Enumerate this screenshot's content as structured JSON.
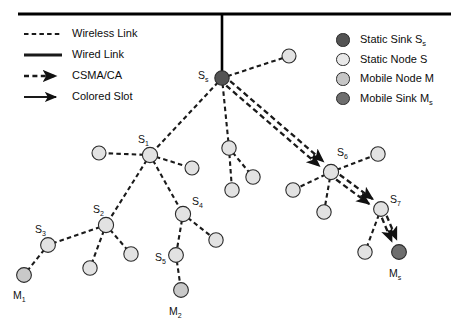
{
  "figure": {
    "width": 454,
    "height": 327,
    "background": "#ffffff"
  },
  "colors": {
    "static_sink": "#535353",
    "static_node": "#e2e2e2",
    "mobile_node": "#c9c9c9",
    "mobile_sink": "#6e6e6e",
    "node_stroke": "#2b2b2b",
    "link": "#1a1a1a",
    "backbone": "#000000",
    "text": "#111111"
  },
  "legend_left": {
    "items": [
      {
        "label": "Wireless Link",
        "style": "dashed-line",
        "name": "wireless-link"
      },
      {
        "label": "Wired Link",
        "style": "solid-line",
        "name": "wired-link"
      },
      {
        "label": "CSMA/CA",
        "style": "dashed-arrow",
        "name": "csma-ca"
      },
      {
        "label": "Colored Slot",
        "style": "solid-arrow",
        "name": "colored-slot"
      }
    ]
  },
  "legend_right": {
    "items": [
      {
        "label": "Static Sink S",
        "sub": "s",
        "fill": "#535353",
        "name": "static-sink"
      },
      {
        "label": "Static Node S",
        "sub": "",
        "fill": "#e8e8e8",
        "name": "static-node"
      },
      {
        "label": "Mobile Node M",
        "sub": "",
        "fill": "#c6c6c6",
        "name": "mobile-node"
      },
      {
        "label": "Mobile Sink M",
        "sub": "s",
        "fill": "#6e6e6e",
        "name": "mobile-sink"
      }
    ]
  },
  "backbone": {
    "horizontal": {
      "x1": 18,
      "y1": 14,
      "x2": 451,
      "y2": 14,
      "width": 3.2
    },
    "vertical": {
      "x1": 222,
      "y1": 14,
      "x2": 222,
      "y2": 78,
      "width": 2.6
    }
  },
  "nodes": [
    {
      "id": "Ss",
      "x": 222,
      "y": 78,
      "r": 7.2,
      "type": "static_sink",
      "label": "S",
      "sub": "s",
      "lx": 198,
      "ly": 70
    },
    {
      "id": "n_tr",
      "x": 289,
      "y": 56,
      "r": 7.0,
      "type": "static_node",
      "label": "",
      "sub": ""
    },
    {
      "id": "S1",
      "x": 150,
      "y": 155,
      "r": 7.6,
      "type": "static_node",
      "label": "S",
      "sub": "1",
      "lx": 138,
      "ly": 134
    },
    {
      "id": "n_l1",
      "x": 99,
      "y": 153,
      "r": 7.0,
      "type": "static_node",
      "label": "",
      "sub": ""
    },
    {
      "id": "n_r1",
      "x": 192,
      "y": 168,
      "r": 7.0,
      "type": "static_node",
      "label": "",
      "sub": ""
    },
    {
      "id": "S2",
      "x": 106,
      "y": 225,
      "r": 7.6,
      "type": "static_node",
      "label": "S",
      "sub": "2",
      "lx": 93,
      "ly": 204
    },
    {
      "id": "S3",
      "x": 48,
      "y": 245,
      "r": 7.4,
      "type": "static_node",
      "label": "S",
      "sub": "3",
      "lx": 35,
      "ly": 224
    },
    {
      "id": "M1",
      "x": 24,
      "y": 275,
      "r": 7.4,
      "type": "mobile_node",
      "label": "M",
      "sub": "1",
      "lx": 13,
      "ly": 290
    },
    {
      "id": "n_b1",
      "x": 90,
      "y": 268,
      "r": 7.2,
      "type": "static_node",
      "label": "",
      "sub": ""
    },
    {
      "id": "n_b2",
      "x": 131,
      "y": 254,
      "r": 7.2,
      "type": "static_node",
      "label": "",
      "sub": ""
    },
    {
      "id": "S4",
      "x": 183,
      "y": 214,
      "r": 7.6,
      "type": "static_node",
      "label": "S",
      "sub": "4",
      "lx": 192,
      "ly": 196
    },
    {
      "id": "n_b3",
      "x": 216,
      "y": 240,
      "r": 7.2,
      "type": "static_node",
      "label": "",
      "sub": ""
    },
    {
      "id": "S5",
      "x": 176,
      "y": 255,
      "r": 7.4,
      "type": "static_node",
      "label": "S",
      "sub": "5",
      "lx": 155,
      "ly": 252
    },
    {
      "id": "M2",
      "x": 181,
      "y": 290,
      "r": 7.4,
      "type": "mobile_node",
      "label": "M",
      "sub": "2",
      "lx": 169,
      "ly": 306
    },
    {
      "id": "n_m1",
      "x": 229,
      "y": 148,
      "r": 7.2,
      "type": "static_node",
      "label": "",
      "sub": ""
    },
    {
      "id": "n_m2",
      "x": 253,
      "y": 177,
      "r": 7.2,
      "type": "static_node",
      "label": "",
      "sub": ""
    },
    {
      "id": "n_m3",
      "x": 232,
      "y": 190,
      "r": 7.2,
      "type": "static_node",
      "label": "",
      "sub": ""
    },
    {
      "id": "S6",
      "x": 331,
      "y": 172,
      "r": 7.6,
      "type": "static_node",
      "label": "S",
      "sub": "6",
      "lx": 337,
      "ly": 147
    },
    {
      "id": "n_r2",
      "x": 378,
      "y": 154,
      "r": 7.2,
      "type": "static_node",
      "label": "",
      "sub": ""
    },
    {
      "id": "n_r3",
      "x": 293,
      "y": 190,
      "r": 7.2,
      "type": "static_node",
      "label": "",
      "sub": ""
    },
    {
      "id": "n_r4",
      "x": 324,
      "y": 212,
      "r": 7.2,
      "type": "static_node",
      "label": "",
      "sub": ""
    },
    {
      "id": "S7",
      "x": 381,
      "y": 209,
      "r": 7.4,
      "type": "static_node",
      "label": "S",
      "sub": "7",
      "lx": 390,
      "ly": 194
    },
    {
      "id": "n_r5",
      "x": 365,
      "y": 252,
      "r": 7.2,
      "type": "static_node",
      "label": "",
      "sub": ""
    },
    {
      "id": "Ms",
      "x": 399,
      "y": 252,
      "r": 7.4,
      "type": "mobile_sink",
      "label": "M",
      "sub": "s",
      "lx": 389,
      "ly": 268
    }
  ],
  "edges": [
    {
      "from": "Ss",
      "to": "n_tr",
      "kind": "wireless"
    },
    {
      "from": "Ss",
      "to": "S1",
      "kind": "wireless"
    },
    {
      "from": "Ss",
      "to": "n_m1",
      "kind": "wireless"
    },
    {
      "from": "S1",
      "to": "n_l1",
      "kind": "wireless"
    },
    {
      "from": "S1",
      "to": "n_r1",
      "kind": "wireless"
    },
    {
      "from": "S1",
      "to": "S2",
      "kind": "wireless"
    },
    {
      "from": "S1",
      "to": "S4",
      "kind": "wireless"
    },
    {
      "from": "S2",
      "to": "S3",
      "kind": "wireless"
    },
    {
      "from": "S3",
      "to": "M1",
      "kind": "wireless"
    },
    {
      "from": "S2",
      "to": "n_b1",
      "kind": "wireless"
    },
    {
      "from": "S2",
      "to": "n_b2",
      "kind": "wireless"
    },
    {
      "from": "S4",
      "to": "n_b3",
      "kind": "wireless"
    },
    {
      "from": "S4",
      "to": "S5",
      "kind": "wireless"
    },
    {
      "from": "S5",
      "to": "M2",
      "kind": "wireless"
    },
    {
      "from": "n_m1",
      "to": "n_m2",
      "kind": "wireless"
    },
    {
      "from": "n_m1",
      "to": "n_m3",
      "kind": "wireless"
    },
    {
      "from": "S6",
      "to": "n_r2",
      "kind": "wireless"
    },
    {
      "from": "S6",
      "to": "n_r3",
      "kind": "wireless"
    },
    {
      "from": "S6",
      "to": "n_r4",
      "kind": "wireless"
    },
    {
      "from": "S7",
      "to": "n_r5",
      "kind": "wireless"
    }
  ],
  "arrows": [
    {
      "from": "Ss",
      "to": "S6",
      "kind": "csma",
      "offset": 3.0
    },
    {
      "from": "Ss",
      "to": "S6",
      "kind": "csma",
      "offset": -3.0
    },
    {
      "from": "S6",
      "to": "S7",
      "kind": "csma",
      "offset": 3.0
    },
    {
      "from": "S6",
      "to": "S7",
      "kind": "csma",
      "offset": -3.0
    },
    {
      "from": "S7",
      "to": "Ms",
      "kind": "csma",
      "offset": 2.6
    },
    {
      "from": "S7",
      "to": "Ms",
      "kind": "csma",
      "offset": -2.6
    }
  ]
}
